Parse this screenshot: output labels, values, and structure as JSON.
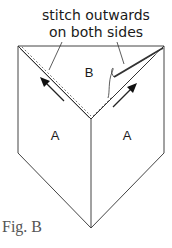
{
  "annotation": {
    "line1": "stitch outwards",
    "line2": "on both sides"
  },
  "labels": {
    "flap_top": "B",
    "panel_left": "A",
    "panel_right": "A"
  },
  "caption": "Fig. B",
  "colors": {
    "line": "#333333",
    "stitch": "#777777",
    "background": "#ffffff"
  }
}
